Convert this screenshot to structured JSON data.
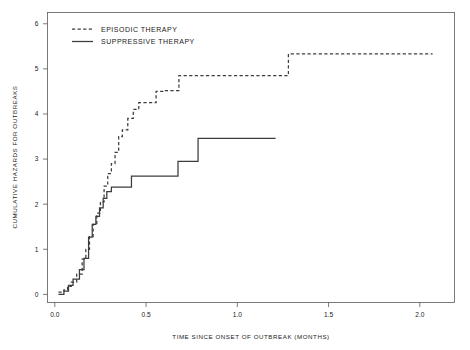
{
  "chart_data": {
    "type": "line",
    "subtype": "step-function-cumulative-hazard",
    "title": "",
    "xlabel": "TIME SINCE ONSET OF OUTBREAK (MONTHS)",
    "ylabel": "CUMULATIVE HAZARDS FOR OUTBREAKS",
    "xlim": [
      -0.04,
      2.19
    ],
    "ylim": [
      -0.18,
      6.25
    ],
    "xticks": [
      0.0,
      0.5,
      1.0,
      1.5,
      2.0
    ],
    "xtick_labels": [
      "0.0",
      "0.5",
      "1.0",
      "1.5",
      "2.0"
    ],
    "yticks": [
      0,
      1,
      2,
      3,
      4,
      5,
      6
    ],
    "ytick_labels": [
      "0",
      "1",
      "2",
      "3",
      "4",
      "5",
      "6"
    ],
    "grid": false,
    "frame": true,
    "legend_position": "top-left",
    "line_color": "#3c3c3c",
    "series": [
      {
        "name": "EPISODIC THERAPY",
        "style": "dashed",
        "x": [
          0.02,
          0.05,
          0.07,
          0.09,
          0.12,
          0.15,
          0.17,
          0.19,
          0.21,
          0.23,
          0.25,
          0.27,
          0.29,
          0.31,
          0.33,
          0.35,
          0.37,
          0.4,
          0.43,
          0.46,
          0.5,
          0.555,
          0.6,
          0.68,
          1.28,
          2.07
        ],
        "y": [
          0.05,
          0.1,
          0.18,
          0.27,
          0.45,
          0.78,
          1.0,
          1.28,
          1.55,
          1.8,
          2.05,
          2.4,
          2.68,
          2.9,
          3.15,
          3.5,
          3.65,
          3.9,
          4.1,
          4.25,
          4.25,
          4.5,
          4.52,
          4.85,
          5.33,
          5.33
        ],
        "final_value": 5.33
      },
      {
        "name": "SUPPRESSIVE THERAPY",
        "style": "solid",
        "x": [
          0.02,
          0.05,
          0.075,
          0.1,
          0.135,
          0.16,
          0.185,
          0.205,
          0.225,
          0.245,
          0.265,
          0.285,
          0.31,
          0.42,
          0.675,
          0.785,
          1.21
        ],
        "y": [
          0.0,
          0.07,
          0.2,
          0.34,
          0.55,
          0.8,
          1.27,
          1.55,
          1.73,
          1.92,
          2.13,
          2.28,
          2.38,
          2.62,
          2.95,
          3.46,
          3.46
        ],
        "final_value": 3.46
      }
    ]
  },
  "legend": {
    "items": [
      {
        "label": "EPISODIC THERAPY",
        "style": "dashed"
      },
      {
        "label": "SUPPRESSIVE THERAPY",
        "style": "solid"
      }
    ]
  },
  "axes": {
    "x_title": "TIME SINCE ONSET OF OUTBREAK (MONTHS)",
    "y_title": "CUMULATIVE HAZARDS FOR OUTBREAKS",
    "x_ticks": [
      "0.0",
      "0.5",
      "1.0",
      "1.5",
      "2.0"
    ],
    "y_ticks": [
      "0",
      "1",
      "2",
      "3",
      "4",
      "5",
      "6"
    ]
  }
}
